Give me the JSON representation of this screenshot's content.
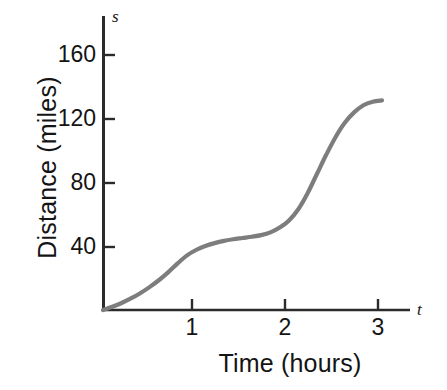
{
  "chart_data": {
    "type": "line",
    "title": "",
    "xlabel": "Time (hours)",
    "ylabel": "Distance (miles)",
    "x_axis_variable": "t",
    "y_axis_variable": "s",
    "xlim": [
      0,
      3.35
    ],
    "ylim": [
      0,
      180
    ],
    "xticks": [
      1,
      2,
      3
    ],
    "xtick_labels": [
      "1",
      "2",
      "3"
    ],
    "yticks": [
      40,
      80,
      120,
      160
    ],
    "ytick_labels": [
      "40",
      "80",
      "120",
      "160"
    ],
    "grid": false,
    "legend": null,
    "series": [
      {
        "name": "distance",
        "color": "#7d7d7d",
        "linewidth": 4.2,
        "x": [
          0.0,
          0.1,
          0.2,
          0.3,
          0.4,
          0.5,
          0.6,
          0.7,
          0.8,
          0.9,
          1.0,
          1.1,
          1.2,
          1.3,
          1.4,
          1.5,
          1.6,
          1.7,
          1.8,
          1.9,
          2.0,
          2.1,
          2.2,
          2.3,
          2.4,
          2.5,
          2.6,
          2.7,
          2.8,
          2.9,
          3.0
        ],
        "y": [
          0.0,
          2.0,
          4.4,
          7.2,
          10.5,
          14.3,
          18.6,
          23.5,
          29.0,
          34.0,
          37.5,
          40.0,
          41.8,
          43.2,
          44.2,
          45.0,
          45.8,
          46.8,
          48.5,
          51.5,
          56.0,
          63.0,
          73.0,
          85.0,
          97.0,
          108.0,
          117.0,
          123.5,
          128.0,
          130.2,
          131.0
        ]
      }
    ],
    "annotations": []
  },
  "axes": {
    "ytick_labels": [
      "160",
      "120",
      "80",
      "40"
    ],
    "xtick_labels": [
      "1",
      "2",
      "3"
    ],
    "y_title": "Distance (miles)",
    "x_title": "Time (hours)",
    "y_variable": "s",
    "x_variable": "t"
  },
  "colors": {
    "curve": "#7d7d7d",
    "axis": "#2b2b2b",
    "text": "#141414",
    "background": "#ffffff"
  }
}
